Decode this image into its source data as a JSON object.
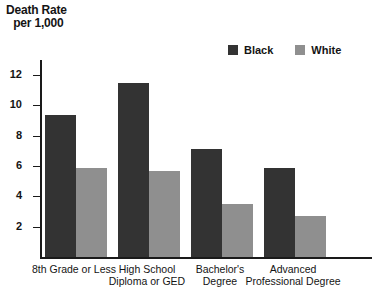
{
  "chart_data": {
    "type": "bar",
    "title": "Death Rate per 1,000",
    "title_lines": [
      "Death Rate",
      "per 1,000"
    ],
    "xlabel": "",
    "ylabel": "Death Rate per 1,000",
    "ylim": [
      0,
      13
    ],
    "yticks": [
      2,
      4,
      6,
      8,
      10,
      12
    ],
    "ytick_labels": [
      "2",
      "4",
      "6",
      "8",
      "10",
      "12"
    ],
    "grid": false,
    "legend_position": "top-right",
    "categories": [
      "8th Grade or Less",
      "High School Diploma or GED",
      "Bachelor's Degree",
      "Advanced Professional Degree"
    ],
    "category_lines": [
      [
        "8th Grade or Less"
      ],
      [
        "High School",
        "Diploma or GED"
      ],
      [
        "Bachelor's",
        "Degree"
      ],
      [
        "Advanced",
        "Professional Degree"
      ]
    ],
    "series": [
      {
        "name": "Black",
        "color": "#333333",
        "values": [
          9.4,
          11.5,
          7.1,
          5.9
        ]
      },
      {
        "name": "White",
        "color": "#8f8f8f",
        "values": [
          5.9,
          5.7,
          3.5,
          2.7
        ]
      }
    ]
  },
  "legend": {
    "items": [
      {
        "label": "Black",
        "color": "#333333"
      },
      {
        "label": "White",
        "color": "#8f8f8f"
      }
    ]
  },
  "axis": {
    "y_title_line1": "Death Rate",
    "y_title_line2": "per 1,000"
  }
}
